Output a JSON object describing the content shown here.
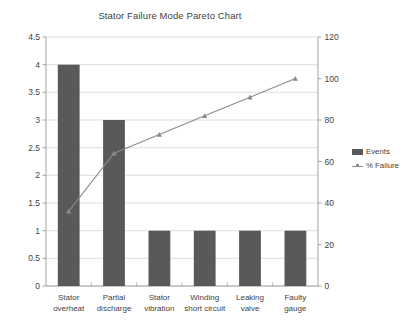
{
  "chart_data": {
    "type": "bar",
    "title": "Stator Failure Mode Pareto Chart",
    "xlabel": "",
    "ylabel": "",
    "categories": [
      "Stator overheat",
      "Partial discharge",
      "Stator vibration",
      "Winding short circuit",
      "Leaking valve",
      "Faulty gauge"
    ],
    "category_lines": [
      [
        "Stator",
        "overheat"
      ],
      [
        "Partial",
        "discharge"
      ],
      [
        "Stator",
        "vibration"
      ],
      [
        "Winding",
        "short circuit"
      ],
      [
        "Leaking",
        "valve"
      ],
      [
        "Faulty",
        "gauge"
      ]
    ],
    "series": [
      {
        "name": "Events",
        "type": "bar",
        "axis": "left",
        "color": "#595959",
        "values": [
          4,
          3,
          1,
          1,
          1,
          1
        ]
      },
      {
        "name": "% Failure",
        "type": "line",
        "axis": "right",
        "color": "#8c8c8c",
        "values": [
          36,
          64,
          73,
          82,
          91,
          100
        ]
      }
    ],
    "left_axis": {
      "min": 0,
      "max": 4.5,
      "step": 0.5,
      "ticks": [
        "0",
        "0.5",
        "1",
        "1.5",
        "2",
        "2.5",
        "3",
        "3.5",
        "4",
        "4.5"
      ]
    },
    "right_axis": {
      "min": 0,
      "max": 120,
      "step": 20,
      "ticks": [
        "0",
        "20",
        "40",
        "60",
        "80",
        "100",
        "120"
      ]
    },
    "grid": true,
    "legend": {
      "position": "right",
      "entries": [
        {
          "label": "Events",
          "marker": "bar-swatch"
        },
        {
          "label": "% Failure",
          "marker": "line-marker"
        }
      ]
    }
  }
}
